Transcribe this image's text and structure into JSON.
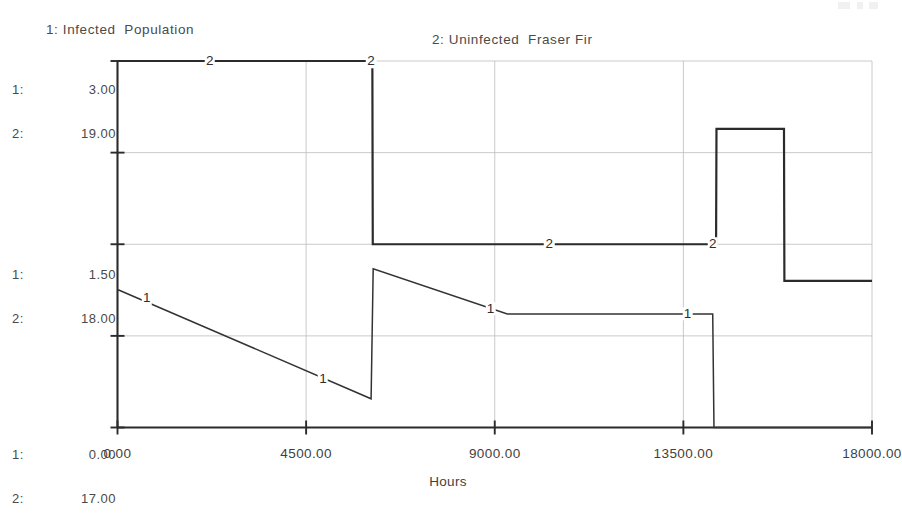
{
  "chart_data": {
    "type": "line",
    "title": "",
    "xlabel": "Hours",
    "ylabel": "",
    "grid": true,
    "legend_position": "top",
    "xlim": [
      0,
      18000
    ],
    "xticks": [
      "0.00",
      "4500.00",
      "9000.00",
      "13500.00",
      "18000.00"
    ],
    "xtick_values": [
      0,
      4500,
      9000,
      13500,
      18000
    ],
    "y_axis_label_rows": [
      {
        "index": "1:",
        "top": "3.00",
        "mid": "1.50",
        "bottom": "0.00"
      },
      {
        "index": "2:",
        "top": "19.00",
        "mid": "18.00",
        "bottom": "17.00"
      }
    ],
    "y_labels": {
      "top": {
        "s1_index": "1:",
        "s1_value": "3.00",
        "s2_index": "2:",
        "s2_value": "19.00"
      },
      "mid": {
        "s1_index": "1:",
        "s1_value": "1.50",
        "s2_index": "2:",
        "s2_value": "18.00"
      },
      "bottom": {
        "s1_index": "1:",
        "s1_value": "0.00",
        "s2_index": "2:",
        "s2_value": "17.00"
      }
    },
    "series": [
      {
        "name": "Infected  Population",
        "legend_text": "1: Infected  Population",
        "marker": "1",
        "axis": 1,
        "ylim": [
          0.0,
          3.0
        ],
        "color": "#333333",
        "marker_points": [
          {
            "x": 700,
            "y": 1.06
          },
          {
            "x": 4900,
            "y": 0.4
          },
          {
            "x": 8900,
            "y": 0.97
          },
          {
            "x": 13600,
            "y": 0.93
          }
        ],
        "points": [
          {
            "x": 0,
            "y": 1.13
          },
          {
            "x": 6050,
            "y": 0.235
          },
          {
            "x": 6100,
            "y": 1.3
          },
          {
            "x": 9300,
            "y": 0.93
          },
          {
            "x": 14200,
            "y": 0.93
          },
          {
            "x": 14230,
            "y": 0.0
          },
          {
            "x": 18000,
            "y": 0.0
          }
        ]
      },
      {
        "name": "Uninfected  Fraser Fir",
        "legend_text": "2: Uninfected  Fraser Fir",
        "marker": "2",
        "axis": 2,
        "ylim": [
          17.0,
          19.0
        ],
        "color": "#2b2b2b",
        "marker_points": [
          {
            "x": 2200,
            "y": 19.0
          },
          {
            "x": 6050,
            "y": 19.0
          },
          {
            "x": 10300,
            "y": 18.0
          },
          {
            "x": 14200,
            "y": 18.0
          }
        ],
        "points": [
          {
            "x": 0,
            "y": 19.0
          },
          {
            "x": 6080,
            "y": 19.0
          },
          {
            "x": 6090,
            "y": 18.0
          },
          {
            "x": 14280,
            "y": 18.0
          },
          {
            "x": 14290,
            "y": 18.63
          },
          {
            "x": 15900,
            "y": 18.63
          },
          {
            "x": 15910,
            "y": 17.8
          },
          {
            "x": 18000,
            "y": 17.8
          }
        ]
      }
    ]
  },
  "legend": {
    "series_1": "1: Infected  Population",
    "series_2": "2: Uninfected  Fraser Fir"
  },
  "axis": {
    "x_title": "Hours",
    "x_tick_labels": [
      "0.00",
      "4500.00",
      "9000.00",
      "13500.00",
      "18000.00"
    ]
  }
}
